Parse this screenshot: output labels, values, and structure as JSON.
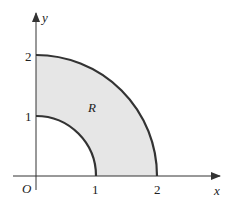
{
  "diagram": {
    "type": "region-between-quarter-circles",
    "region": {
      "label": "R",
      "fill": "#e6e6e6",
      "inner_radius": 1,
      "outer_radius": 2,
      "quadrant": "first"
    },
    "axes": {
      "x_label": "x",
      "y_label": "y",
      "origin_label": "O",
      "x_ticks": [
        "1",
        "2"
      ],
      "y_ticks": [
        "1",
        "2"
      ]
    },
    "colors": {
      "axis": "#333333",
      "curve": "#333333",
      "region_fill": "#e6e6e6"
    }
  }
}
